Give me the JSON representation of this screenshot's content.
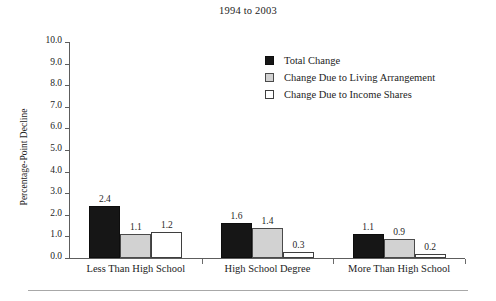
{
  "chart_data": {
    "type": "bar",
    "title": "1994 to 2003",
    "xlabel": "",
    "ylabel": "Percentage-Point Decline",
    "ylim": [
      0.0,
      10.0
    ],
    "ytick_step": 1.0,
    "ytick_labels": [
      "10.0",
      "9.0",
      "8.0",
      "7.0",
      "6.0",
      "5.0",
      "4.0",
      "3.0",
      "2.0",
      "1.0",
      "0.0"
    ],
    "ytick_values": [
      10.0,
      9.0,
      8.0,
      7.0,
      6.0,
      5.0,
      4.0,
      3.0,
      2.0,
      1.0,
      0.0
    ],
    "grid": false,
    "legend_position": "upper right inside",
    "categories": [
      "Less Than High School",
      "High School Degree",
      "More Than High School"
    ],
    "series": [
      {
        "name": "Total Change",
        "key": "total",
        "color": "#161616",
        "values": [
          2.4,
          1.6,
          1.1
        ],
        "labels": [
          "2.4",
          "1.6",
          "1.1"
        ]
      },
      {
        "name": "Change Due to Living Arrangement",
        "key": "living",
        "color": "#d2d2d2",
        "values": [
          1.1,
          1.4,
          0.9
        ],
        "labels": [
          "1.1",
          "1.4",
          "0.9"
        ]
      },
      {
        "name": "Change Due to Income Shares",
        "key": "income",
        "color": "#ffffff",
        "values": [
          1.2,
          0.3,
          0.2
        ],
        "labels": [
          "1.2",
          "0.3",
          "0.2"
        ]
      }
    ]
  },
  "axis": {
    "line_color": "#5d5d5d"
  },
  "figure": {
    "background": "#ffffff",
    "rule_color": "#a8a8a8"
  }
}
